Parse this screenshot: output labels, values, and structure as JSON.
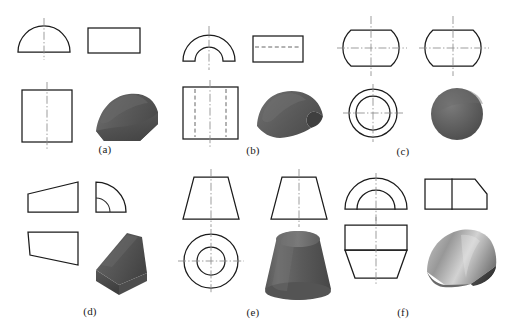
{
  "figure": {
    "background_color": "#ffffff",
    "line_color": "#1b1b1b",
    "hidden_line_color": "#555555",
    "center_line_color": "#8c8c8c",
    "solid_fill_color": "#5a5a5a",
    "width": 508,
    "height": 328
  },
  "panels": [
    {
      "id": "a",
      "caption": "(a)",
      "solid_name": "half-cylinder-on-block",
      "views": [
        {
          "name": "front-view",
          "shape": "semicircle-with-vertical-centerline"
        },
        {
          "name": "side-view",
          "shape": "rectangle"
        },
        {
          "name": "top-view",
          "shape": "square-with-vertical-centerline"
        },
        {
          "name": "pictorial-view",
          "shape": "shaded-half-cylinder-solid"
        }
      ]
    },
    {
      "id": "b",
      "caption": "(b)",
      "solid_name": "hollow-half-cylinder-shell",
      "views": [
        {
          "name": "front-view",
          "shape": "concentric-semicircle-arch-with-centerline"
        },
        {
          "name": "side-view",
          "shape": "rectangle-with-horizontal-centerline"
        },
        {
          "name": "top-view",
          "shape": "rectangle-with-two-hidden-lines-and-centerline"
        },
        {
          "name": "pictorial-view",
          "shape": "shaded-curved-shell-solid"
        }
      ]
    },
    {
      "id": "c",
      "caption": "(c)",
      "solid_name": "truncated-sphere",
      "views": [
        {
          "name": "front-view",
          "shape": "circle-flattened-top-and-bottom-with-crosshair"
        },
        {
          "name": "side-view",
          "shape": "circle-flattened-top-and-bottom-with-crosshair"
        },
        {
          "name": "top-view",
          "shape": "concentric-circles-with-crosshair"
        },
        {
          "name": "pictorial-view",
          "shape": "shaded-sphere-solid"
        }
      ]
    },
    {
      "id": "d",
      "caption": "(d)",
      "solid_name": "tapered-wedge-block",
      "views": [
        {
          "name": "front-view",
          "shape": "trapezoid-rising-to-right"
        },
        {
          "name": "side-view",
          "shape": "quarter-round-with-inner-arc"
        },
        {
          "name": "top-view",
          "shape": "quadrilateral-with-slanted-bottom"
        },
        {
          "name": "pictorial-view",
          "shape": "shaded-tapered-wedge-solid"
        }
      ]
    },
    {
      "id": "e",
      "caption": "(e)",
      "solid_name": "truncated-cone-frustum",
      "views": [
        {
          "name": "front-view",
          "shape": "trapezoid-with-vertical-centerline"
        },
        {
          "name": "side-view",
          "shape": "trapezoid-with-vertical-centerline"
        },
        {
          "name": "top-view",
          "shape": "concentric-circles-with-crosshair"
        },
        {
          "name": "pictorial-view",
          "shape": "shaded-cone-frustum-solid"
        }
      ]
    },
    {
      "id": "f",
      "caption": "(f)",
      "solid_name": "domed-tapered-solid",
      "views": [
        {
          "name": "front-view",
          "shape": "concentric-semicircles-over-rectangle"
        },
        {
          "name": "side-view",
          "shape": "rectangle-with-chamfered-right-block"
        },
        {
          "name": "top-view",
          "shape": "rectangle-over-trapezoid-with-centerline"
        },
        {
          "name": "pictorial-view",
          "shape": "shaded-domed-tapered-solid"
        }
      ]
    }
  ]
}
